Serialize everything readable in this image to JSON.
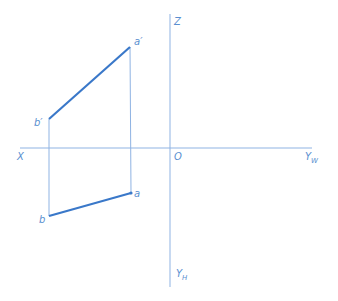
{
  "diagram": {
    "type": "orthographic-projection-of-line-segment",
    "colors": {
      "axis": "#8fb3e3",
      "projector": "#8fb3e3",
      "segment": "#3a78c9",
      "label": "#5a8fd0"
    },
    "axes": {
      "x_label": "X",
      "z_label": "Z",
      "origin_label": "O",
      "yw_label": "Y",
      "yw_sub": "W",
      "yh_label": "Y",
      "yh_sub": "H"
    },
    "points": {
      "a_prime": {
        "label": "a′",
        "x": 130,
        "y": 47
      },
      "b_prime": {
        "label": "b′",
        "x": 49,
        "y": 119
      },
      "a": {
        "label": "a",
        "x": 131,
        "y": 193
      },
      "b": {
        "label": "b",
        "x": 49,
        "y": 216
      }
    }
  }
}
